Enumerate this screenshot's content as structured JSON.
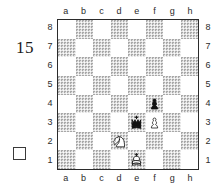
{
  "diagram": {
    "number": "15",
    "side_to_move_indicator": "white-empty-square",
    "board": {
      "files": [
        "a",
        "b",
        "c",
        "d",
        "e",
        "f",
        "g",
        "h"
      ],
      "ranks": [
        "8",
        "7",
        "6",
        "5",
        "4",
        "3",
        "2",
        "1"
      ],
      "light_square_color": "#ffffff",
      "dark_square_color": "#a8a8a8",
      "border_color": "#2b2b2b",
      "pieces": [
        {
          "square": "f4",
          "file": "f",
          "rank": "4",
          "piece": "pawn",
          "color": "black",
          "glyph": "black-pawn"
        },
        {
          "square": "e3",
          "file": "e",
          "rank": "3",
          "piece": "king",
          "color": "black",
          "glyph": "black-king"
        },
        {
          "square": "f3",
          "file": "f",
          "rank": "3",
          "piece": "pawn",
          "color": "white",
          "glyph": "white-pawn"
        },
        {
          "square": "d2",
          "file": "d",
          "rank": "2",
          "piece": "knight",
          "color": "white",
          "glyph": "white-knight"
        },
        {
          "square": "e1",
          "file": "e",
          "rank": "1",
          "piece": "king",
          "color": "white",
          "glyph": "white-king"
        }
      ]
    }
  }
}
